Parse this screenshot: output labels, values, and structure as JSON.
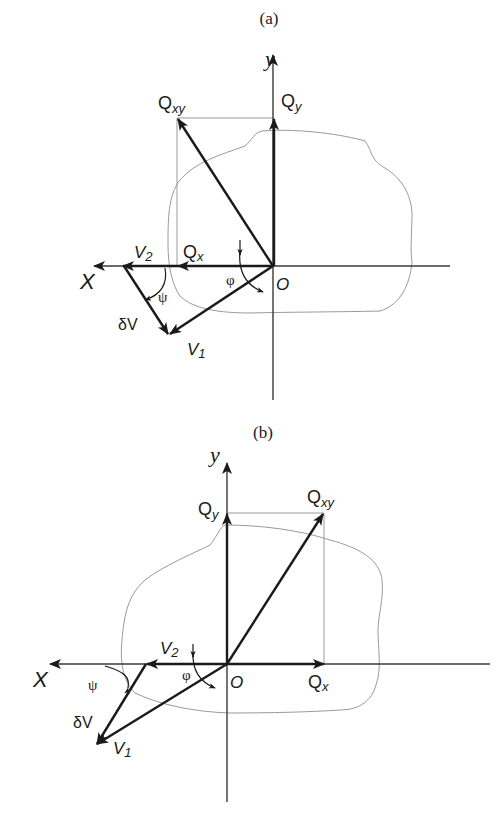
{
  "figure": {
    "panels": [
      {
        "id": "a",
        "caption": "(a)",
        "axes": {
          "x_label": "X",
          "y_label": "y",
          "origin_label": "O"
        },
        "vectors": {
          "Qxy": {
            "label_main": "Q",
            "label_sub": "xy"
          },
          "Qy": {
            "label_main": "Q",
            "label_sub": "y"
          },
          "Qx": {
            "label_main": "Q",
            "label_sub": "x"
          },
          "V1": {
            "label_main": "V",
            "label_sub": "1"
          },
          "V2": {
            "label_main": "V",
            "label_sub": "2"
          },
          "dV": {
            "label": "δV"
          }
        },
        "angles": {
          "phi": "φ",
          "psi": "ψ"
        }
      },
      {
        "id": "b",
        "caption": "(b)",
        "axes": {
          "x_label": "X",
          "y_label": "y",
          "origin_label": "O"
        },
        "vectors": {
          "Qxy": {
            "label_main": "Q",
            "label_sub": "xy"
          },
          "Qy": {
            "label_main": "Q",
            "label_sub": "y"
          },
          "Qx": {
            "label_main": "Q",
            "label_sub": "x"
          },
          "V1": {
            "label_main": "V",
            "label_sub": "1"
          },
          "V2": {
            "label_main": "V",
            "label_sub": "2"
          },
          "dV": {
            "label": "δV"
          }
        },
        "angles": {
          "phi": "φ",
          "psi": "ψ"
        }
      }
    ],
    "colors": {
      "ink": "#1a1a1a",
      "axis": "#3a3a3a",
      "guide": "#9a9a9a",
      "background": "#ffffff"
    }
  }
}
